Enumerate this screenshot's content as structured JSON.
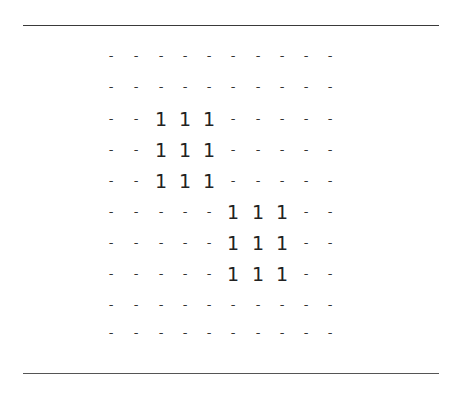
{
  "matrix": {
    "rows": [
      [
        "-",
        "-",
        "-",
        "-",
        "-",
        "-",
        "-",
        "-",
        "-",
        "-"
      ],
      [
        "-",
        "-",
        "-",
        "-",
        "-",
        "-",
        "-",
        "-",
        "-",
        "-"
      ],
      [
        "-",
        "-",
        "1",
        "1",
        "1",
        "-",
        "-",
        "-",
        "-",
        "-"
      ],
      [
        "-",
        "-",
        "1",
        "1",
        "1",
        "-",
        "-",
        "-",
        "-",
        "-"
      ],
      [
        "-",
        "-",
        "1",
        "1",
        "1",
        "-",
        "-",
        "-",
        "-",
        "-"
      ],
      [
        "-",
        "-",
        "-",
        "-",
        "-",
        "1",
        "1",
        "1",
        "-",
        "-"
      ],
      [
        "-",
        "-",
        "-",
        "-",
        "-",
        "1",
        "1",
        "1",
        "-",
        "-"
      ],
      [
        "-",
        "-",
        "-",
        "-",
        "-",
        "1",
        "1",
        "1",
        "-",
        "-"
      ],
      [
        "-",
        "-",
        "-",
        "-",
        "-",
        "-",
        "-",
        "-",
        "-",
        "-"
      ],
      [
        "-",
        "-",
        "-",
        "-",
        "-",
        "-",
        "-",
        "-",
        "-",
        "-"
      ]
    ]
  }
}
